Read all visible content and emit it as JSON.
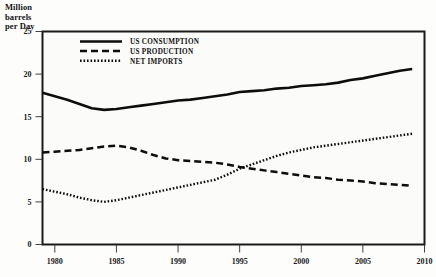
{
  "axis_title": "Million\nbarrels\nper Day",
  "legend": {
    "items": [
      {
        "label": "US CONSUMPTION",
        "style": "solid"
      },
      {
        "label": "US PRODUCTION",
        "style": "dashed"
      },
      {
        "label": "NET IMPORTS",
        "style": "dotted"
      }
    ]
  },
  "chart_data": {
    "type": "line",
    "title": "",
    "subtitle": "",
    "xlabel": "",
    "ylabel": "Million barrels per Day",
    "xlim": [
      1979,
      2010
    ],
    "ylim": [
      0,
      25
    ],
    "yticks": [
      0,
      5,
      10,
      15,
      20,
      25
    ],
    "xticks": [
      1980,
      1985,
      1990,
      1995,
      2000,
      2005,
      2010
    ],
    "ytick_labels": [
      "0",
      "5",
      "10",
      "15",
      "20",
      "25"
    ],
    "xtick_labels": [
      "1980",
      "1985",
      "1990",
      "1995",
      "2000",
      "2005",
      "2010"
    ],
    "grid": "horizontal",
    "legend_position": "top-left-inside",
    "x": [
      1979,
      1980,
      1981,
      1982,
      1983,
      1984,
      1985,
      1986,
      1987,
      1988,
      1989,
      1990,
      1991,
      1992,
      1993,
      1994,
      1995,
      1996,
      1997,
      1998,
      1999,
      2000,
      2001,
      2002,
      2003,
      2004,
      2005,
      2006,
      2007,
      2008,
      2009
    ],
    "series": [
      {
        "name": "US CONSUMPTION",
        "style": "solid",
        "values": [
          17.8,
          17.4,
          17.0,
          16.5,
          16.0,
          15.8,
          15.9,
          16.1,
          16.3,
          16.5,
          16.7,
          16.9,
          17.0,
          17.2,
          17.4,
          17.6,
          17.9,
          18.0,
          18.1,
          18.3,
          18.4,
          18.6,
          18.7,
          18.8,
          19.0,
          19.3,
          19.5,
          19.8,
          20.1,
          20.4,
          20.6
        ],
        "start_value": 17.8,
        "min_value": 15.8,
        "max_value": 20.6
      },
      {
        "name": "US PRODUCTION",
        "style": "dashed",
        "values": [
          10.8,
          10.9,
          11.0,
          11.1,
          11.3,
          11.5,
          11.6,
          11.4,
          11.0,
          10.5,
          10.1,
          9.9,
          9.8,
          9.7,
          9.6,
          9.4,
          9.1,
          8.9,
          8.7,
          8.5,
          8.3,
          8.1,
          7.9,
          7.8,
          7.6,
          7.5,
          7.4,
          7.2,
          7.1,
          7.0,
          6.9
        ],
        "start_value": 10.8,
        "max_value": 11.6,
        "end_value": 6.9
      },
      {
        "name": "NET IMPORTS",
        "style": "dotted",
        "values": [
          6.5,
          6.2,
          5.9,
          5.5,
          5.2,
          5.0,
          5.2,
          5.5,
          5.8,
          6.1,
          6.4,
          6.7,
          7.0,
          7.3,
          7.6,
          8.2,
          8.9,
          9.4,
          9.9,
          10.4,
          10.8,
          11.1,
          11.4,
          11.6,
          11.8,
          12.0,
          12.2,
          12.4,
          12.6,
          12.8,
          13.0
        ],
        "start_value": 6.5,
        "min_value": 5.0,
        "end_value": 13.0
      }
    ]
  },
  "colors": {
    "line": "#0d0d0d",
    "grid": "#b9b9b9",
    "frame": "#1a1a1a",
    "plot_background": "#fbfbfa",
    "text": "#141414"
  }
}
